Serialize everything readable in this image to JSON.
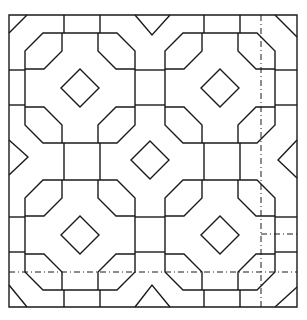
{
  "figure": {
    "title": "",
    "colors": {
      "line": "#1a1a1a",
      "background": "#ffffff"
    },
    "border": {
      "x1": 9,
      "y1": 15,
      "x2": 297,
      "y2": 307
    },
    "diamond_centers": [
      [
        80,
        88
      ],
      [
        220,
        88
      ],
      [
        150,
        160
      ],
      [
        80,
        235
      ],
      [
        220,
        235
      ]
    ],
    "diamond_half_size": 19,
    "octagon_centers": [
      [
        80,
        88
      ],
      [
        220,
        88
      ],
      [
        80,
        235
      ],
      [
        220,
        235
      ]
    ],
    "octagon_half_size": 55,
    "octagon_chamfer": 18,
    "dashed_lines": [
      {
        "x1": 261,
        "y1": 15,
        "x2": 261,
        "y2": 307
      },
      {
        "x1": 9,
        "y1": 272,
        "x2": 297,
        "y2": 272
      },
      {
        "x1": 261,
        "y1": 234,
        "x2": 297,
        "y2": 234
      }
    ]
  }
}
